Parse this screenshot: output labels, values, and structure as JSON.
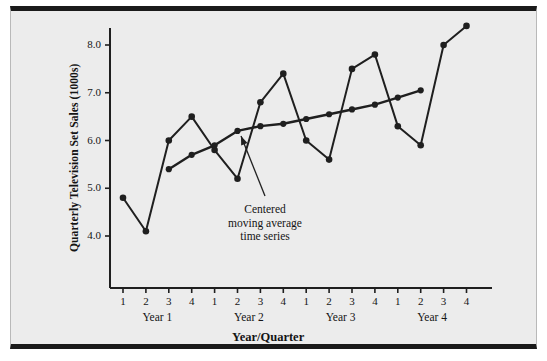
{
  "chart_data": {
    "type": "line",
    "title": "",
    "xlabel": "Year/Quarter",
    "ylabel": "Quarterly Television Set Sales (1000s)",
    "ylim": [
      3.5,
      8.7
    ],
    "yticks": [
      "4.0",
      "5.0",
      "6.0",
      "7.0",
      "8.0"
    ],
    "ytick_values": [
      4.0,
      5.0,
      6.0,
      7.0,
      8.0
    ],
    "grid": false,
    "legend": "none",
    "x": [
      1,
      2,
      3,
      4,
      5,
      6,
      7,
      8,
      9,
      10,
      11,
      12,
      13,
      14,
      15,
      16
    ],
    "xtick_labels": [
      "1",
      "2",
      "3",
      "4",
      "1",
      "2",
      "3",
      "4",
      "1",
      "2",
      "3",
      "4",
      "1",
      "2",
      "3",
      "4"
    ],
    "group_labels": [
      "Year 1",
      "Year 2",
      "Year 3",
      "Year 4"
    ],
    "group_centers": [
      2.5,
      6.5,
      10.5,
      14.5
    ],
    "series": [
      {
        "name": "Quarterly television set sales",
        "values": [
          4.8,
          4.1,
          6.0,
          6.5,
          5.8,
          5.2,
          6.8,
          7.4,
          6.0,
          5.6,
          7.5,
          7.8,
          6.3,
          5.9,
          8.0,
          8.4
        ]
      },
      {
        "name": "Centered moving average time series",
        "x": [
          3,
          4,
          5,
          6,
          7,
          8,
          9,
          10,
          11,
          12,
          13,
          14
        ],
        "values": [
          5.4,
          5.7,
          5.9,
          6.2,
          6.3,
          6.35,
          6.45,
          6.55,
          6.65,
          6.75,
          6.9,
          7.05
        ]
      }
    ],
    "annotations": [
      {
        "text": "Centered\nmoving average\ntime series",
        "text_x": 265,
        "text_y": 203,
        "arrow_from_x": 265,
        "arrow_from_y": 196,
        "arrow_to_x": 241,
        "arrow_to_y": 136
      }
    ],
    "colors": {
      "background": "#ececec",
      "frame": "#1a1a1a",
      "line": "#1f1f1f",
      "marker": "#1f1f1f",
      "axis": "#1f1f1f",
      "text": "#141414"
    }
  }
}
